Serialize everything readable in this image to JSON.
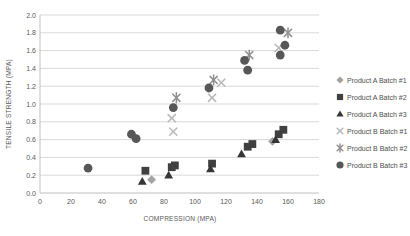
{
  "chart_data": {
    "type": "scatter",
    "title": "",
    "xlabel": "COMPRESSION (MPA)",
    "ylabel": "TENSILE STRENGTH (MPA)",
    "xlim": [
      0,
      180
    ],
    "ylim": [
      0.0,
      2.0
    ],
    "x_ticks": [
      "0",
      "20",
      "40",
      "60",
      "80",
      "100",
      "120",
      "140",
      "160",
      "180"
    ],
    "y_ticks": [
      "0.0",
      "0.2",
      "0.4",
      "0.6",
      "0.8",
      "1.0",
      "1.2",
      "1.4",
      "1.6",
      "1.8",
      "2.0"
    ],
    "grid": "horizontal",
    "legend_position": "right",
    "colors": {
      "background": "#ffffff",
      "gridline": "#d9d9d9",
      "axis_line": "#bfbfbf",
      "tick_text": "#595959",
      "legend_text": "#4d4d4d"
    },
    "series": [
      {
        "name": "Product A Batch #1",
        "marker": "diamond",
        "color": "#a3a3a3",
        "points": [
          [
            72,
            0.15
          ],
          [
            150,
            0.58
          ]
        ]
      },
      {
        "name": "Product A Batch #2",
        "marker": "square",
        "color": "#404040",
        "points": [
          [
            68,
            0.25
          ],
          [
            85,
            0.29
          ],
          [
            87,
            0.31
          ],
          [
            111,
            0.33
          ],
          [
            134,
            0.52
          ],
          [
            137,
            0.55
          ],
          [
            154,
            0.66
          ],
          [
            157,
            0.71
          ]
        ]
      },
      {
        "name": "Product A Batch #3",
        "marker": "triangle",
        "color": "#363636",
        "points": [
          [
            66,
            0.13
          ],
          [
            83,
            0.2
          ],
          [
            110,
            0.27
          ],
          [
            130,
            0.44
          ],
          [
            152,
            0.6
          ]
        ]
      },
      {
        "name": "Product B Batch #1",
        "marker": "x",
        "color": "#b8b8b8",
        "points": [
          [
            85,
            0.84
          ],
          [
            86,
            0.69
          ],
          [
            111,
            1.07
          ],
          [
            117,
            1.24
          ],
          [
            154,
            1.63
          ]
        ]
      },
      {
        "name": "Product B Batch #2",
        "marker": "asterisk",
        "color": "#8f8f8f",
        "points": [
          [
            88,
            1.07
          ],
          [
            112,
            1.27
          ],
          [
            135,
            1.55
          ],
          [
            160,
            1.8
          ]
        ]
      },
      {
        "name": "Product B Batch #3",
        "marker": "circle",
        "color": "#575757",
        "points": [
          [
            31,
            0.28
          ],
          [
            59,
            0.66
          ],
          [
            62,
            0.61
          ],
          [
            86,
            0.96
          ],
          [
            109,
            1.18
          ],
          [
            132,
            1.49
          ],
          [
            134,
            1.38
          ],
          [
            155,
            1.55
          ],
          [
            158,
            1.66
          ],
          [
            155,
            1.83
          ]
        ]
      }
    ]
  }
}
